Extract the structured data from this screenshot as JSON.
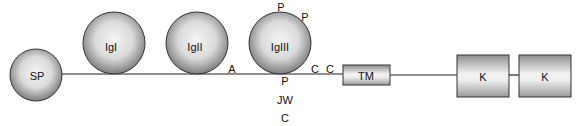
{
  "diagram": {
    "domains": [
      {
        "id": "sp",
        "label": "SP",
        "shape": "circle"
      },
      {
        "id": "igI",
        "label": "IgI",
        "shape": "circle"
      },
      {
        "id": "igII",
        "label": "IgII",
        "shape": "circle"
      },
      {
        "id": "igIII",
        "label": "IgIII",
        "shape": "circle"
      },
      {
        "id": "tm",
        "label": "TM",
        "shape": "rect"
      },
      {
        "id": "k1",
        "label": "K",
        "shape": "rect"
      },
      {
        "id": "k2",
        "label": "K",
        "shape": "rect"
      }
    ],
    "annotations": {
      "a": "A",
      "p_top": "P",
      "p_top_right": "P",
      "c1": "C",
      "c2": "C",
      "p_below": "P",
      "jw": "JW",
      "c_below": "C"
    },
    "colors": {
      "line": "#222222",
      "fill_light": "#f2f2f2",
      "fill_dark": "#8a8a8a"
    }
  }
}
